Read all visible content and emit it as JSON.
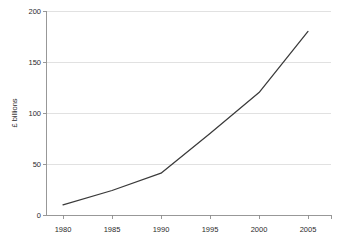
{
  "chart_data": {
    "type": "line",
    "title": "",
    "xlabel": "",
    "ylabel": "£ billions",
    "xlim": [
      1978,
      2007
    ],
    "ylim": [
      0,
      200
    ],
    "grid": true,
    "legend": false,
    "x_ticks": [
      "1980",
      "1985",
      "1990",
      "1995",
      "2000",
      "2005"
    ],
    "x_tick_values": [
      1980,
      1985,
      1990,
      1995,
      2000,
      2005
    ],
    "y_ticks": [
      "0",
      "50",
      "100",
      "150",
      "200"
    ],
    "y_tick_values": [
      0,
      50,
      100,
      150,
      200
    ],
    "series": [
      {
        "name": "£ billions",
        "color": "#3a3a3a",
        "x": [
          1980,
          1985,
          1990,
          1995,
          2000,
          2005
        ],
        "values": [
          10,
          24,
          41,
          80,
          120,
          180
        ],
        "points": [
          {
            "x": 1980,
            "y": 10
          },
          {
            "x": 1985,
            "y": 24
          },
          {
            "x": 1990,
            "y": 41
          },
          {
            "x": 1995,
            "y": 80
          },
          {
            "x": 2000,
            "y": 120
          },
          {
            "x": 2005,
            "y": 180
          }
        ]
      }
    ]
  },
  "colors": {
    "background": "#ffffff",
    "series": "#3a3a3a",
    "gridline": "#d4d4d4",
    "axis": "#8d8d8d",
    "text": "#2b2b2b"
  },
  "labels": {
    "y_axis_title": "£ billions",
    "y_0": "0",
    "y_50": "50",
    "y_100": "100",
    "y_150": "150",
    "y_200": "200",
    "x_1980": "1980",
    "x_1985": "1985",
    "x_1990": "1990",
    "x_1995": "1995",
    "x_2000": "2000",
    "x_2005": "2005"
  }
}
